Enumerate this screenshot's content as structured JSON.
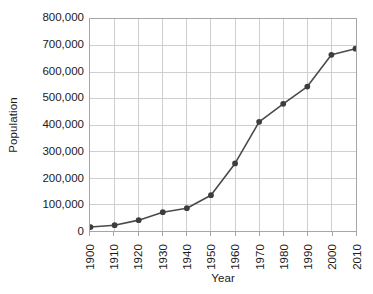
{
  "chart_data": {
    "type": "line",
    "title": "",
    "xlabel": "Year",
    "ylabel": "Population",
    "x": [
      1900,
      1910,
      1920,
      1930,
      1940,
      1950,
      1960,
      1970,
      1980,
      1990,
      2000,
      2010
    ],
    "categories": [
      "1900",
      "1910",
      "1920",
      "1930",
      "1940",
      "1950",
      "1960",
      "1970",
      "1980",
      "1990",
      "2000",
      "2010"
    ],
    "values": [
      15000,
      22000,
      41000,
      71000,
      86000,
      135000,
      255000,
      412000,
      480000,
      545000,
      665000,
      688000
    ],
    "series": [
      {
        "name": "Population",
        "values": [
          15000,
          22000,
          41000,
          71000,
          86000,
          135000,
          255000,
          412000,
          480000,
          545000,
          665000,
          688000
        ]
      }
    ],
    "xlim": [
      1900,
      2010
    ],
    "ylim": [
      0,
      800000
    ],
    "ytick_labels": [
      "0",
      "100,000",
      "200,000",
      "300,000",
      "400,000",
      "500,000",
      "600,000",
      "700,000",
      "800,000"
    ],
    "ytick_values": [
      0,
      100000,
      200000,
      300000,
      400000,
      500000,
      600000,
      700000,
      800000
    ],
    "xtick_labels": [
      "1900",
      "1910",
      "1920",
      "1930",
      "1940",
      "1950",
      "1960",
      "1970",
      "1980",
      "1990",
      "2000",
      "2010"
    ],
    "grid": true,
    "grid_axes": "both",
    "legend": false,
    "legend_position": "none",
    "xtick_rotation": 90,
    "marker": "circle",
    "colors": {
      "line": "#4a4a4a",
      "marker": "#3d3d3d",
      "grid": "#cfcfcf",
      "axis": "#a6a6a6",
      "text": "#1a1a1a",
      "background": "#ffffff"
    }
  }
}
